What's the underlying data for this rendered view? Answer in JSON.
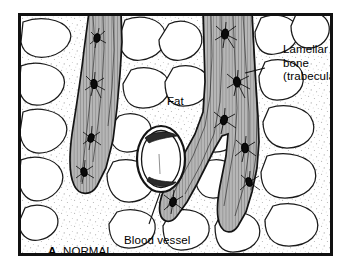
{
  "figure": {
    "panel_letter": "A.",
    "panel_caption": "NORMAL"
  },
  "labels": {
    "lamellar_line1": "Lamellar",
    "lamellar_line2": "bone",
    "lamellar_line3": "(trabecula)",
    "fat": "Fat",
    "blood_vessel": "Blood vessel"
  },
  "colors": {
    "ink": "#111111",
    "outline": "#1a1a1a",
    "trabecula_fill": "#b4b4b4",
    "trabecula_lamella": "#8c8c8c",
    "marrow_background": "#ffffff",
    "fat_cell_fill": "#ffffff",
    "stipple": "#9a9a9a",
    "osteocyte": "#000000",
    "frame": "#111111",
    "page": "#ffffff"
  },
  "structures": {
    "trabeculae_count": 2,
    "trabecula_left_osteocytes": 4,
    "trabecula_right_osteocytes": 6,
    "blood_vessel_shape": "oval",
    "fat_cells_visible": 24,
    "features": [
      "lamellar striations",
      "osteocyte lacunae",
      "canaliculi",
      "adipocytes",
      "stippled marrow"
    ]
  }
}
